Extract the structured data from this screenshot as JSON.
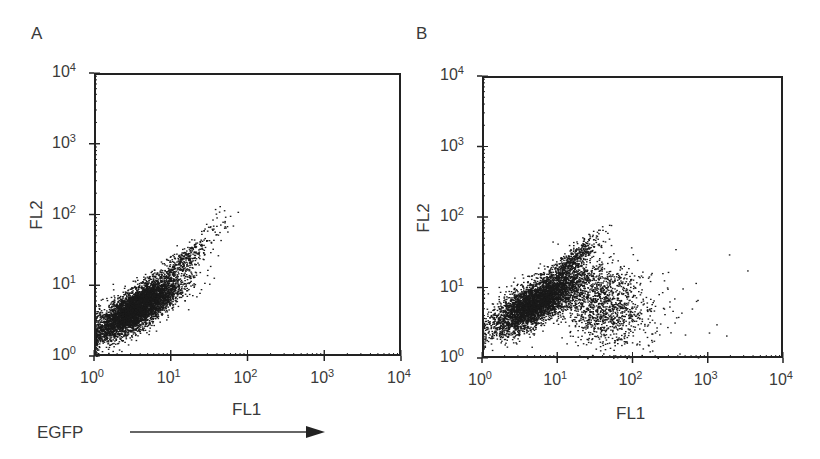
{
  "figure": {
    "panels": [
      {
        "id": "A",
        "label": "A"
      },
      {
        "id": "B",
        "label": "B"
      }
    ],
    "footer": {
      "egfp_label": "EGFP",
      "arrow_direction": "right"
    }
  },
  "chart_data": [
    {
      "type": "scatter",
      "panel": "A",
      "title": "A",
      "xlabel": "FL1",
      "ylabel": "FL2",
      "xscale": "log",
      "yscale": "log",
      "xlim": [
        1,
        10000
      ],
      "ylim": [
        1,
        10000
      ],
      "x_ticks": [
        "10^0",
        "10^1",
        "10^2",
        "10^3",
        "10^4"
      ],
      "y_ticks": [
        "10^0",
        "10^1",
        "10^2",
        "10^3",
        "10^4"
      ],
      "grid": false,
      "legend": null,
      "description": "Single diagonal population (EGFP-negative); FL1 ~1-60, FL2 ~1-120",
      "populations": [
        {
          "name": "main",
          "n": 5200,
          "center_log": [
            0.55,
            0.68
          ],
          "spread_log": [
            0.28,
            0.22
          ],
          "diag_corr": 0.78
        },
        {
          "name": "tail",
          "n": 380,
          "center_log": [
            1.15,
            1.35
          ],
          "spread_log": [
            0.22,
            0.2
          ],
          "diag_corr": 0.9
        },
        {
          "name": "sparse-top",
          "n": 28,
          "center_log": [
            1.55,
            1.88
          ],
          "spread_log": [
            0.1,
            0.1
          ],
          "diag_corr": 0.6
        }
      ]
    },
    {
      "type": "scatter",
      "panel": "B",
      "title": "B",
      "xlabel": "FL1",
      "ylabel": "FL2",
      "xscale": "log",
      "yscale": "log",
      "xlim": [
        1,
        10000
      ],
      "ylim": [
        1,
        10000
      ],
      "x_ticks": [
        "10^0",
        "10^1",
        "10^2",
        "10^3",
        "10^4"
      ],
      "y_ticks": [
        "10^0",
        "10^1",
        "10^2",
        "10^3",
        "10^4"
      ],
      "grid": false,
      "legend": null,
      "description": "Diagonal negative population plus a separate EGFP-positive population shifted right (FL1 ~20-500)",
      "populations": [
        {
          "name": "negative-main",
          "n": 4200,
          "center_log": [
            0.72,
            0.8
          ],
          "spread_log": [
            0.3,
            0.22
          ],
          "diag_corr": 0.72
        },
        {
          "name": "negative-tail",
          "n": 450,
          "center_log": [
            1.2,
            1.4
          ],
          "spread_log": [
            0.18,
            0.18
          ],
          "diag_corr": 0.88
        },
        {
          "name": "egfp-positive",
          "n": 1300,
          "center_log": [
            1.6,
            0.78
          ],
          "spread_log": [
            0.3,
            0.3
          ],
          "diag_corr": -0.15
        },
        {
          "name": "sparse-outliers",
          "n": 55,
          "center_log": [
            2.3,
            0.65
          ],
          "spread_log": [
            0.45,
            0.35
          ],
          "diag_corr": 0
        }
      ]
    }
  ],
  "style": {
    "dot_color": "#1a1a1a",
    "frame_color": "#222222",
    "text_color": "#3a3a3a"
  }
}
